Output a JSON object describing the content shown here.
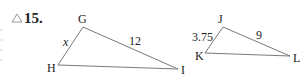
{
  "problem": {
    "number": "15.",
    "icon": "triangle-outline-icon"
  },
  "figures": [
    {
      "name": "triangle-GHI",
      "vertices": {
        "G": {
          "label": "G",
          "x": 83,
          "y": 27
        },
        "H": {
          "label": "H",
          "x": 58,
          "y": 65
        },
        "I": {
          "label": "I",
          "x": 178,
          "y": 69
        }
      },
      "sides": {
        "GH": "x",
        "GI": "12"
      }
    },
    {
      "name": "triangle-JKL",
      "vertices": {
        "J": {
          "label": "J",
          "x": 223,
          "y": 27
        },
        "K": {
          "label": "K",
          "x": 205,
          "y": 53
        },
        "L": {
          "label": "L",
          "x": 290,
          "y": 56
        }
      },
      "sides": {
        "JK": "3.75",
        "JL": "9"
      }
    }
  ],
  "colors": {
    "line": "#7a7a7a",
    "text": "#222222",
    "icon": "#9a9a9a"
  }
}
